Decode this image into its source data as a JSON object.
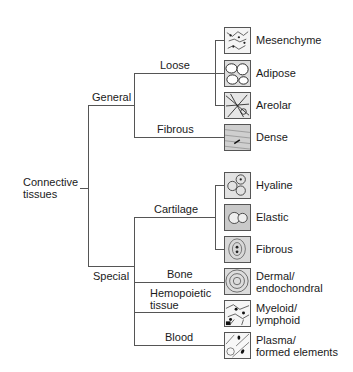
{
  "root": {
    "label_line1": "Connective",
    "label_line2": "tissues"
  },
  "branches": {
    "general": {
      "label": "General",
      "children": {
        "loose": {
          "label": "Loose",
          "leaves": [
            "Mesenchyme",
            "Adipose",
            "Areolar"
          ]
        },
        "fibrous": {
          "label": "Fibrous",
          "leaves": [
            "Dense"
          ]
        }
      }
    },
    "special": {
      "label": "Special",
      "children": {
        "cartilage": {
          "label": "Cartilage",
          "leaves": [
            "Hyaline",
            "Elastic",
            "Fibrous"
          ]
        },
        "bone": {
          "label": "Bone",
          "leaf_line1": "Dermal/",
          "leaf_line2": "endochondral"
        },
        "hemopoietic": {
          "label_line1": "Hemopoietic",
          "label_line2": "tissue",
          "leaf_line1": "Myeloid/",
          "leaf_line2": "lymphoid"
        },
        "blood": {
          "label": "Blood",
          "leaf_line1": "Plasma/",
          "leaf_line2": "formed elements"
        }
      }
    }
  },
  "icons": [
    "mesenchyme-icon",
    "adipose-icon",
    "areolar-icon",
    "dense-icon",
    "hyaline-icon",
    "elastic-icon",
    "fibrous-cartilage-icon",
    "bone-icon",
    "myeloid-icon",
    "blood-icon"
  ]
}
